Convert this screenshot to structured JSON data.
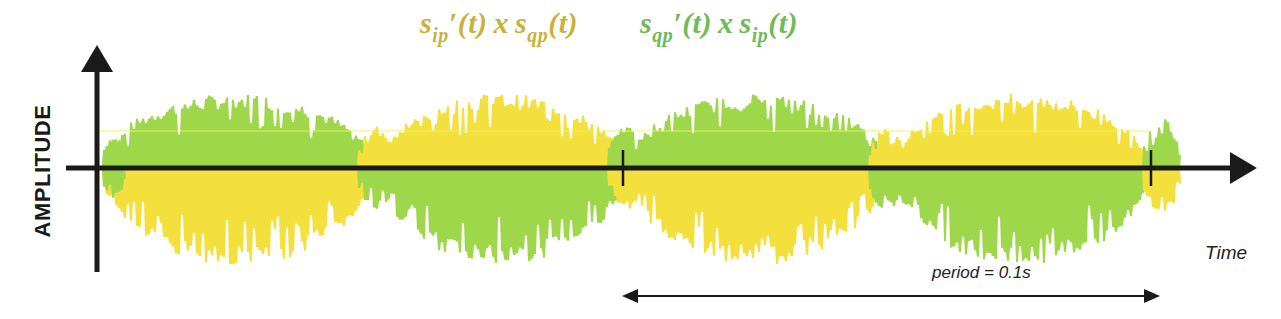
{
  "diagram": {
    "type": "signal-waveform",
    "y_axis_label": "AMPLITUDE",
    "x_axis_label": "Time",
    "period_annotation": "period = 0.1s",
    "colors": {
      "yellow_signal": "#f3e03c",
      "green_signal": "#9ed84a",
      "formula_yellow": "#c8b23c",
      "formula_green": "#6dbb59",
      "axis": "#1a1a1a",
      "reference_line": "#e8f25a"
    },
    "legend": [
      {
        "id": "yellow",
        "s1": "s",
        "s1_sub": "ip",
        "prime": "′(t)",
        "op": "x",
        "s2": "s",
        "s2_sub": "qp",
        "arg": "(t)",
        "full_text": "s_ip'(t) x s_qp(t)"
      },
      {
        "id": "green",
        "s1": "s",
        "s1_sub": "qp",
        "prime": "′(t)",
        "op": "x",
        "s2": "s",
        "s2_sub": "ip",
        "arg": "(t)",
        "full_text": "s_qp'(t) x s_ip(t)"
      }
    ],
    "segments": [
      {
        "x_start": 100,
        "x_end": 372,
        "top_color": "green",
        "bottom_color": "yellow"
      },
      {
        "x_start": 378,
        "x_end": 622,
        "top_color": "yellow",
        "bottom_color": "green"
      },
      {
        "x_start": 626,
        "x_end": 884,
        "top_color": "green",
        "bottom_color": "yellow"
      },
      {
        "x_start": 893,
        "x_end": 1148,
        "top_color": "yellow",
        "bottom_color": "green"
      }
    ],
    "tick_marks_x": [
      623,
      1151
    ],
    "period_arrow": {
      "x_start": 622,
      "x_end": 1160,
      "y": 292
    }
  }
}
